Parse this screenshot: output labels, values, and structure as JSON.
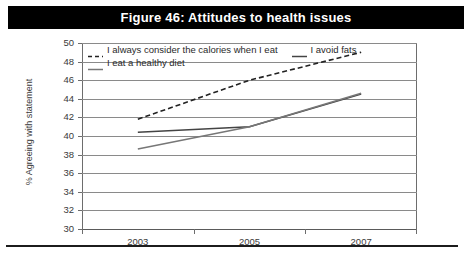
{
  "figure": {
    "title": "Figure 46: Attitudes to health issues",
    "title_bg": "#000000",
    "title_fg": "#ffffff"
  },
  "chart_data": {
    "type": "line",
    "title": "Figure 46: Attitudes to health issues",
    "xlabel": "",
    "ylabel": "% Agreeing with statement",
    "ylim": [
      30,
      50
    ],
    "ytick_step": 2,
    "yticks": [
      50,
      48,
      46,
      44,
      42,
      40,
      38,
      36,
      34,
      32,
      30
    ],
    "xticks": [
      "2003",
      "2005",
      "2007"
    ],
    "x": [
      2003,
      2005,
      2007
    ],
    "grid": "horizontal",
    "legend_position": "top-inside",
    "series": [
      {
        "name": "I always consider the calories when I eat",
        "style": "dashed",
        "color": "#222222",
        "values": [
          41.8,
          46.0,
          49.0
        ]
      },
      {
        "name": "I avoid fats",
        "style": "solid",
        "color": "#444444",
        "values": [
          40.4,
          41.0,
          44.5
        ]
      },
      {
        "name": "I eat a healthy diet",
        "style": "solid",
        "color": "#777777",
        "values": [
          38.6,
          41.0,
          44.6
        ]
      }
    ]
  },
  "legend": {
    "row1": [
      {
        "label": "I always consider the calories when I eat",
        "marker": "dashed-line-marker"
      },
      {
        "label": "I avoid fats",
        "marker": "solid-line-marker"
      }
    ],
    "row2": [
      {
        "label": "I eat a healthy diet",
        "marker": "solid-line-marker"
      }
    ]
  }
}
